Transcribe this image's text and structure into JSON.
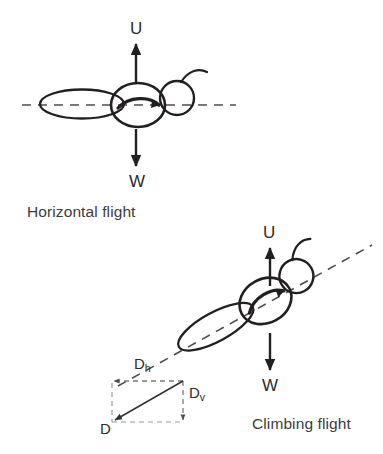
{
  "figure": {
    "background_color": "#ffffff",
    "stroke_color": "#231f20",
    "dashed_color": "#4d4d4d",
    "text_color": "#3a3a3a"
  },
  "panels": [
    {
      "id": "horizontal",
      "caption": "Horizontal flight",
      "flight_path_angle_deg": 0,
      "forces": [
        {
          "name": "lift",
          "label": "U",
          "direction": "up"
        },
        {
          "name": "weight",
          "label": "W",
          "direction": "down"
        }
      ]
    },
    {
      "id": "climbing",
      "caption": "Climbing flight",
      "flight_path_angle_deg": 28,
      "forces": [
        {
          "name": "lift",
          "label": "U",
          "direction": "up"
        },
        {
          "name": "weight",
          "label": "W",
          "direction": "down"
        }
      ],
      "components": [
        {
          "name": "drag-total",
          "label": "D",
          "sub": ""
        },
        {
          "name": "drag-horizontal",
          "label": "D",
          "sub": "h"
        },
        {
          "name": "drag-vertical",
          "label": "D",
          "sub": "v"
        }
      ]
    }
  ],
  "labels": {
    "u_top": "U",
    "w_top": "W",
    "u_bottom": "U",
    "w_bottom": "W",
    "caption_horizontal": "Horizontal flight",
    "caption_climbing": "Climbing flight",
    "d_main": "D",
    "d_h_base": "D",
    "d_h_sub": "h",
    "d_v_base": "D",
    "d_v_sub": "v"
  }
}
